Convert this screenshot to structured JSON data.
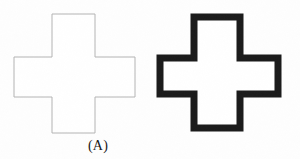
{
  "figure": {
    "background_color": "#fefefe",
    "width": 300,
    "height": 159,
    "captions": {
      "panel_a_label": "(A)"
    },
    "shapes": [
      {
        "id": "cross-thin",
        "name": "thin-outline-cross",
        "role": "left figure, panel A",
        "stroke_color": "#b4b4b4",
        "fill_color": "#ffffff",
        "stroke_width": 1,
        "bbox": {
          "x": 14,
          "y": 14,
          "width": 121,
          "height": 119
        },
        "arm_width": 43,
        "polygon_points": "52,14 95,14 95,57 135,57 135,97 95,97 95,133 52,133 52,97 14,97 14,57 52,57"
      },
      {
        "id": "cross-thick",
        "name": "thick-outline-cross",
        "role": "right figure",
        "stroke_color": "#1a1a1a",
        "fill_color": "#ffffff",
        "stroke_width": 7,
        "bbox": {
          "x": 156,
          "y": 13,
          "width": 126,
          "height": 119
        },
        "arm_width": 46,
        "polygon_points": "194,17 240,17 240,58 278,58 278,94 240,94 240,128 194,128 194,94 160,94 160,58 194,58"
      }
    ]
  }
}
